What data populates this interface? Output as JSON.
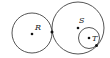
{
  "diagram": {
    "type": "tangent circles",
    "circles": [
      {
        "name": "R",
        "label": "R",
        "description": "left circle, externally tangent to circle S"
      },
      {
        "name": "S",
        "label": "S",
        "description": "large circle"
      },
      {
        "name": "T",
        "label": "T",
        "description": "small circle, internally tangent to circle S"
      }
    ],
    "points": [
      {
        "name": "center-R",
        "label": "R"
      },
      {
        "name": "center-S",
        "label": "S"
      },
      {
        "name": "center-T",
        "label": "T"
      },
      {
        "name": "tangent-point-RS",
        "label": ""
      },
      {
        "name": "tangent-point-ST",
        "label": ""
      }
    ],
    "colors": {
      "stroke": "#555555",
      "point": "#111111"
    }
  }
}
